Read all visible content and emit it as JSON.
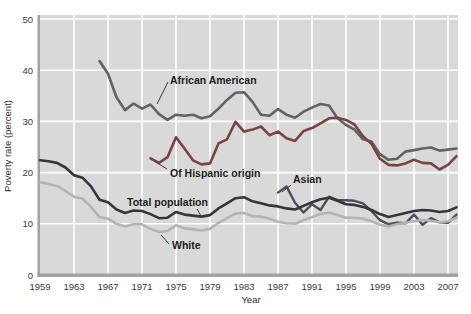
{
  "chart_data": {
    "type": "line",
    "title": "",
    "xlabel": "Year",
    "ylabel": "Poverty rate (percent)",
    "xlim": [
      1959,
      2008
    ],
    "ylim": [
      0,
      50
    ],
    "grid": true,
    "legend_position": "inline-annotations",
    "x_ticks": [
      1959,
      1963,
      1967,
      1971,
      1975,
      1979,
      1983,
      1987,
      1991,
      1995,
      1999,
      2003,
      2007
    ],
    "y_ticks": [
      0,
      10,
      20,
      30,
      40,
      50
    ],
    "colors": {
      "plot_background": "#d9d9d9",
      "gridline": "#ffffff",
      "axis": "#a2a2a2",
      "african_american": "#626262",
      "hispanic": "#7b4340",
      "asian": "#4b505c",
      "total_population": "#35353c",
      "white": "#b4b4b4"
    },
    "series": [
      {
        "name": "African American",
        "slug": "african-american",
        "color": "#626262",
        "width": 2.6,
        "start_year": 1966,
        "values": [
          41.8,
          39.3,
          34.7,
          32.2,
          33.5,
          32.5,
          33.3,
          31.4,
          30.3,
          31.3,
          31.1,
          31.3,
          30.6,
          31.0,
          32.5,
          34.2,
          35.6,
          35.7,
          33.8,
          31.3,
          31.1,
          32.4,
          31.3,
          30.7,
          31.9,
          32.7,
          33.4,
          33.1,
          30.6,
          29.3,
          28.4,
          26.5,
          26.1,
          23.6,
          22.5,
          22.7,
          24.1,
          24.4,
          24.7,
          24.9,
          24.3,
          24.5,
          24.7
        ]
      },
      {
        "name": "Of Hispanic origin",
        "slug": "hispanic",
        "color": "#7b4340",
        "width": 2.6,
        "start_year": 1972,
        "values": [
          22.8,
          21.9,
          23.0,
          26.9,
          24.7,
          22.4,
          21.6,
          21.8,
          25.7,
          26.5,
          29.9,
          28.0,
          28.4,
          29.0,
          27.3,
          28.0,
          26.7,
          26.2,
          28.1,
          28.7,
          29.6,
          30.6,
          30.7,
          30.3,
          29.4,
          27.1,
          25.6,
          22.7,
          21.5,
          21.4,
          21.8,
          22.5,
          21.9,
          21.8,
          20.6,
          21.5,
          23.2
        ]
      },
      {
        "name": "Asian",
        "slug": "asian",
        "color": "#4b505c",
        "width": 2.4,
        "start_year": 1987,
        "values": [
          16.1,
          17.3,
          14.1,
          12.2,
          13.8,
          12.7,
          15.3,
          14.6,
          14.6,
          14.5,
          14.0,
          12.5,
          10.7,
          9.9,
          10.2,
          10.1,
          11.8,
          9.8,
          11.1,
          10.3,
          10.2,
          11.8
        ]
      },
      {
        "name": "Total population",
        "slug": "total-population",
        "color": "#35353c",
        "width": 2.6,
        "start_year": 1959,
        "values": [
          22.4,
          22.2,
          21.9,
          21.0,
          19.5,
          19.0,
          17.3,
          14.7,
          14.2,
          12.8,
          12.1,
          12.6,
          12.5,
          11.9,
          11.1,
          11.2,
          12.3,
          11.8,
          11.6,
          11.4,
          11.7,
          13.0,
          14.0,
          15.0,
          15.2,
          14.4,
          14.0,
          13.6,
          13.4,
          13.0,
          12.8,
          13.5,
          14.2,
          14.8,
          15.1,
          14.5,
          13.8,
          13.7,
          13.3,
          12.7,
          11.9,
          11.3,
          11.7,
          12.1,
          12.5,
          12.7,
          12.6,
          12.3,
          12.5,
          13.2
        ]
      },
      {
        "name": "White",
        "slug": "white",
        "color": "#b4b4b4",
        "width": 2.6,
        "start_year": 1959,
        "values": [
          18.1,
          17.8,
          17.4,
          16.4,
          15.3,
          14.9,
          13.3,
          11.3,
          11.0,
          10.0,
          9.5,
          9.9,
          9.9,
          9.0,
          8.4,
          8.6,
          9.7,
          9.1,
          8.9,
          8.7,
          9.0,
          10.2,
          11.1,
          12.0,
          12.1,
          11.5,
          11.4,
          11.0,
          10.4,
          10.1,
          10.0,
          10.7,
          11.3,
          11.9,
          12.2,
          11.7,
          11.2,
          11.2,
          11.0,
          10.5,
          9.8,
          9.5,
          9.9,
          10.2,
          10.5,
          10.8,
          10.6,
          10.3,
          10.5,
          11.2
        ]
      }
    ],
    "annotations": [
      {
        "text": "African American",
        "slug": "african-american",
        "tx": 170,
        "ty": 84,
        "leader": [
          168,
          82,
          157,
          104
        ]
      },
      {
        "text": "Of Hispanic origin",
        "slug": "hispanic",
        "tx": 170,
        "ty": 177,
        "leader": [
          167,
          169,
          154,
          161
        ]
      },
      {
        "text": "Total population",
        "slug": "total-population",
        "tx": 127,
        "ty": 206,
        "leader": [
          197,
          209,
          201,
          216
        ]
      },
      {
        "text": "Asian",
        "slug": "asian",
        "tx": 293,
        "ty": 183,
        "leader": [
          291,
          185,
          282,
          192
        ]
      },
      {
        "text": "White",
        "slug": "white",
        "tx": 172,
        "ty": 249,
        "leader": [
          169,
          244,
          161,
          235
        ]
      }
    ]
  }
}
